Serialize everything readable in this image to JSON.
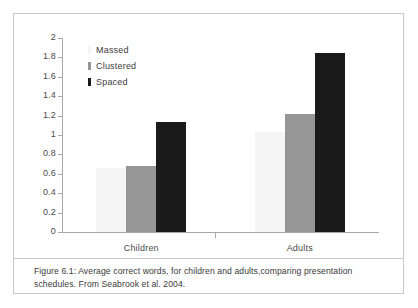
{
  "figure": {
    "caption": "Figure 6.1: Average correct words, for children and adults,comparing presentation schedules. From Seabrook et al. 2004.",
    "frame_border_color": "#c9c9c9"
  },
  "legend": {
    "position": "inside-top-left",
    "entries": [
      {
        "label": "Massed",
        "color": "#f5f5f5"
      },
      {
        "label": "Clustered",
        "color": "#969696"
      },
      {
        "label": "Spaced",
        "color": "#1a1a1a"
      }
    ]
  },
  "chart_data": {
    "type": "bar",
    "title": "",
    "xlabel": "",
    "ylabel": "",
    "ylim": [
      0,
      2
    ],
    "yticks": [
      0,
      0.2,
      0.4,
      0.6,
      0.8,
      1,
      1.2,
      1.4,
      1.6,
      1.8,
      2
    ],
    "ytick_labels": [
      "0",
      "0.2",
      "0.4",
      "0.6",
      "0.8",
      "1",
      "1.2",
      "1.4",
      "1.6",
      "1.8",
      "2"
    ],
    "grid": false,
    "categories": [
      "Children",
      "Adults"
    ],
    "series": [
      {
        "name": "Massed",
        "color": "#f5f5f5",
        "values": [
          0.66,
          1.03
        ]
      },
      {
        "name": "Clustered",
        "color": "#969696",
        "values": [
          0.68,
          1.22
        ]
      },
      {
        "name": "Spaced",
        "color": "#1a1a1a",
        "values": [
          1.13,
          1.85
        ]
      }
    ],
    "axis_color": "#a8a8a8",
    "legend_position": "inside-top-left"
  }
}
